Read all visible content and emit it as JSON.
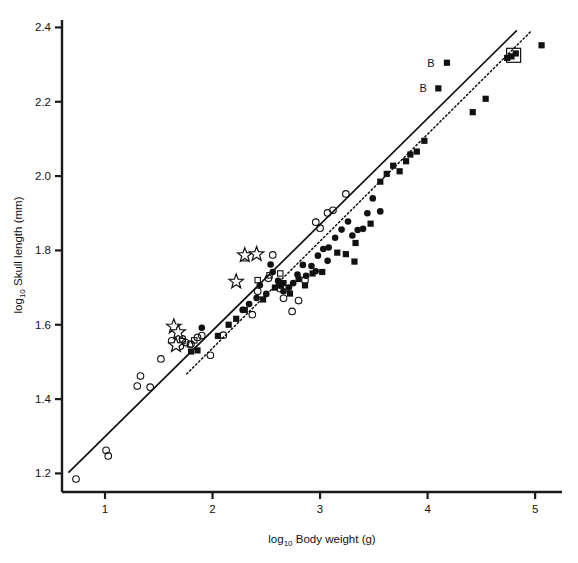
{
  "chart_data": {
    "type": "scatter",
    "title": "",
    "xlabel": "log10 Body weight (g)",
    "ylabel": "log10 Skull length (mm)",
    "xlabel_prefix": "log",
    "xlabel_sub": "10",
    "xlabel_rest": "Body weight (g)",
    "ylabel_prefix": "log",
    "ylabel_sub": "10",
    "ylabel_rest": "Skull length (mm)",
    "xlim": [
      0.6,
      5.25
    ],
    "ylim": [
      1.15,
      2.42
    ],
    "xticks": [
      1,
      2,
      3,
      4,
      5
    ],
    "xtick_labels": [
      "1",
      "2",
      "3",
      "4",
      "5"
    ],
    "yticks": [
      1.2,
      1.4,
      1.6,
      1.8,
      2.0,
      2.2,
      2.4
    ],
    "ytick_labels": [
      "1.2",
      "1.4",
      "1.6",
      "1.8",
      "2.0",
      "2.2",
      "2.4"
    ],
    "grid": false,
    "legend": "none",
    "annotations": [
      {
        "text": "B",
        "x": 4.03,
        "y": 2.305
      },
      {
        "text": "B",
        "x": 3.96,
        "y": 2.236
      }
    ],
    "lines": [
      {
        "name": "solid-regression-line",
        "style": "solid",
        "x0": 0.66,
        "y0": 1.202,
        "x1": 4.83,
        "y1": 2.392
      },
      {
        "name": "dotted-regression-line",
        "style": "dotted",
        "x0": 1.76,
        "y0": 1.468,
        "x1": 4.97,
        "y1": 2.392
      }
    ],
    "series": [
      {
        "name": "open-circle",
        "marker": "open-circle",
        "points": [
          [
            0.73,
            1.185
          ],
          [
            1.01,
            1.262
          ],
          [
            1.03,
            1.247
          ],
          [
            1.33,
            1.462
          ],
          [
            1.3,
            1.435
          ],
          [
            1.42,
            1.432
          ],
          [
            1.52,
            1.508
          ],
          [
            1.62,
            1.557
          ],
          [
            1.66,
            1.545
          ],
          [
            1.7,
            1.542
          ],
          [
            1.72,
            1.562
          ],
          [
            1.75,
            1.552
          ],
          [
            1.8,
            1.548
          ],
          [
            1.86,
            1.566
          ],
          [
            1.9,
            1.571
          ],
          [
            1.98,
            1.518
          ],
          [
            2.1,
            1.572
          ],
          [
            2.37,
            1.627
          ],
          [
            2.42,
            1.69
          ],
          [
            2.52,
            1.725
          ],
          [
            2.56,
            1.788
          ],
          [
            2.63,
            1.697
          ],
          [
            2.66,
            1.671
          ],
          [
            2.8,
            1.665
          ],
          [
            2.86,
            1.72
          ],
          [
            2.96,
            1.876
          ],
          [
            3.0,
            1.86
          ],
          [
            3.07,
            1.901
          ],
          [
            3.12,
            1.908
          ],
          [
            3.24,
            1.952
          ],
          [
            2.74,
            1.636
          ]
        ]
      },
      {
        "name": "open-square",
        "marker": "open-square",
        "points": [
          [
            1.72,
            1.556
          ],
          [
            1.79,
            1.547
          ],
          [
            1.83,
            1.558
          ],
          [
            2.3,
            1.779
          ],
          [
            2.42,
            1.72
          ],
          [
            2.53,
            1.733
          ],
          [
            2.63,
            1.738
          ]
        ]
      },
      {
        "name": "filled-circle",
        "marker": "filled-circle",
        "points": [
          [
            1.9,
            1.592
          ],
          [
            2.44,
            1.706
          ],
          [
            2.54,
            1.762
          ],
          [
            2.56,
            1.742
          ],
          [
            2.61,
            1.718
          ],
          [
            2.63,
            1.705
          ],
          [
            2.66,
            1.69
          ],
          [
            2.71,
            1.7
          ],
          [
            2.75,
            1.712
          ],
          [
            2.79,
            1.735
          ],
          [
            2.84,
            1.761
          ],
          [
            2.87,
            1.732
          ],
          [
            2.92,
            1.758
          ],
          [
            2.96,
            1.744
          ],
          [
            2.98,
            1.786
          ],
          [
            3.03,
            1.804
          ],
          [
            3.08,
            1.808
          ],
          [
            3.14,
            1.834
          ],
          [
            3.2,
            1.856
          ],
          [
            3.26,
            1.878
          ],
          [
            3.3,
            1.84
          ],
          [
            3.35,
            1.855
          ],
          [
            3.4,
            1.858
          ],
          [
            3.44,
            1.9
          ],
          [
            3.49,
            1.94
          ],
          [
            2.5,
            1.683
          ],
          [
            2.41,
            1.672
          ],
          [
            2.34,
            1.656
          ],
          [
            2.28,
            1.64
          ],
          [
            3.07,
            1.772
          ],
          [
            3.56,
            1.905
          ]
        ]
      },
      {
        "name": "filled-square",
        "marker": "filled-square",
        "points": [
          [
            1.8,
            1.528
          ],
          [
            1.86,
            1.531
          ],
          [
            2.05,
            1.57
          ],
          [
            2.15,
            1.6
          ],
          [
            2.22,
            1.616
          ],
          [
            2.3,
            1.64
          ],
          [
            2.47,
            1.668
          ],
          [
            2.58,
            1.7
          ],
          [
            2.66,
            1.712
          ],
          [
            2.72,
            1.684
          ],
          [
            2.8,
            1.723
          ],
          [
            2.86,
            1.706
          ],
          [
            2.93,
            1.738
          ],
          [
            3.02,
            1.742
          ],
          [
            3.16,
            1.794
          ],
          [
            3.24,
            1.79
          ],
          [
            3.33,
            1.82
          ],
          [
            3.47,
            1.872
          ],
          [
            3.56,
            1.985
          ],
          [
            3.62,
            2.006
          ],
          [
            3.68,
            2.028
          ],
          [
            3.74,
            2.013
          ],
          [
            3.8,
            2.04
          ],
          [
            3.84,
            2.058
          ],
          [
            3.9,
            2.066
          ],
          [
            3.97,
            2.095
          ],
          [
            4.1,
            2.236
          ],
          [
            4.18,
            2.305
          ],
          [
            4.54,
            2.208
          ],
          [
            4.74,
            2.318
          ],
          [
            4.78,
            2.322
          ],
          [
            4.82,
            2.33
          ],
          [
            5.06,
            2.352
          ],
          [
            4.42,
            2.172
          ],
          [
            3.32,
            1.77
          ]
        ]
      },
      {
        "name": "open-square-large-highlight",
        "marker": "open-square-large",
        "points": [
          [
            4.8,
            2.325
          ]
        ]
      },
      {
        "name": "open-star",
        "marker": "open-star",
        "points": [
          [
            1.64,
            1.595
          ],
          [
            1.68,
            1.58
          ],
          [
            1.66,
            1.545
          ],
          [
            2.22,
            1.716
          ],
          [
            2.3,
            1.787
          ],
          [
            2.41,
            1.79
          ]
        ]
      }
    ]
  }
}
